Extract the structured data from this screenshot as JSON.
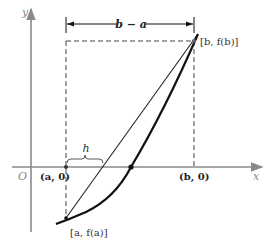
{
  "figure": {
    "type": "secant-method-diagram",
    "axes": {
      "x_label": "x",
      "y_label": "y",
      "origin_label": "O"
    },
    "points": {
      "a_axis": "(a, 0)",
      "b_axis": "(b, 0)",
      "fa": "[a, f(a)]",
      "fb": "[b, f(b)]"
    },
    "dimension": {
      "width_label": "b − a",
      "offset_label": "h"
    },
    "colors": {
      "axis": "#8a8a8a",
      "curve": "#111111",
      "chord": "#222222",
      "dashed": "#444444"
    }
  }
}
